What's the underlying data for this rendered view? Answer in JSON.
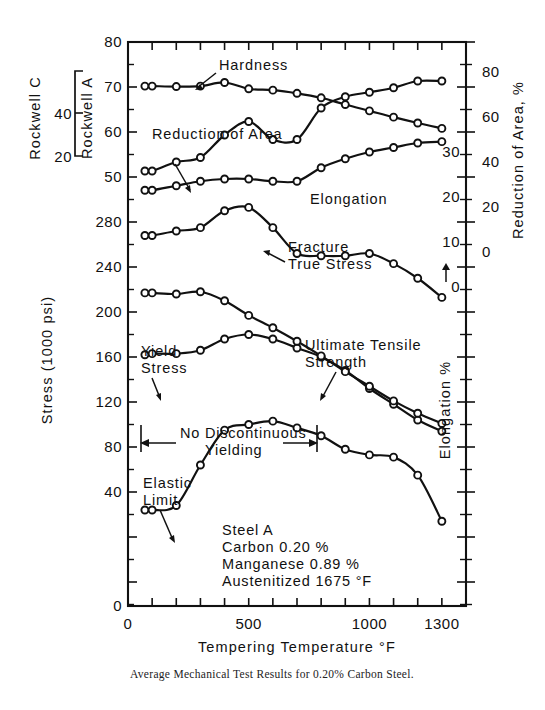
{
  "figure": {
    "caption": "Average Mechanical Test Results for 0.20% Carbon Steel."
  },
  "axes": {
    "x": {
      "title": "Tempering Temperature °F",
      "labels": [
        "0",
        "500",
        "1000",
        "1300"
      ],
      "label_values": [
        0,
        500,
        1000,
        1300
      ],
      "range": [
        0,
        1400
      ],
      "tick_step": 100
    },
    "left_stress": {
      "title": "Stress (1000 psi)",
      "labels": [
        "0",
        "40",
        "80",
        "120",
        "160",
        "200",
        "240",
        "280"
      ],
      "range": [
        0,
        300
      ]
    },
    "left_rockwell_a": {
      "title": "Rockwell A",
      "labels": [
        "50",
        "60",
        "70",
        "80"
      ],
      "range": [
        45,
        80
      ]
    },
    "left_rockwell_c": {
      "title": "Rockwell C",
      "labels": [
        "20",
        "40"
      ]
    },
    "right_elongation": {
      "title": "Elongation %",
      "labels": [
        "0",
        "10",
        "20",
        "30"
      ],
      "arrow": "↑"
    },
    "right_reduction": {
      "title": "Reduction of Area, %",
      "labels": [
        "0",
        "20",
        "40",
        "60",
        "80"
      ]
    }
  },
  "annotations": {
    "no_discontinuous_yielding": {
      "line1": "No Discontinuous",
      "line2": "Yielding",
      "arrow_left": "←",
      "arrow_right": "→"
    },
    "specimen": {
      "line1": "Steel A",
      "line2": "Carbon 0.20 %",
      "line3": "Manganese 0.89 %",
      "line4": "Austenitized 1675 °F"
    }
  },
  "chart_data": {
    "type": "line",
    "title": "Average Mechanical Test Results for 0.20% Carbon Steel.",
    "xlabel": "Tempering Temperature °F",
    "ylabel": "Stress (1000 psi)",
    "xlim": [
      0,
      1400
    ],
    "grid": false,
    "legend": "inline-labels",
    "series": [
      {
        "name": "Hardness",
        "unit": "Rockwell A",
        "axis": "left-rockwell-a",
        "x": [
          70,
          100,
          200,
          300,
          400,
          500,
          600,
          700,
          800,
          900,
          1000,
          1100,
          1200,
          1300
        ],
        "y": [
          70.2,
          70.2,
          70.1,
          70.2,
          71.0,
          69.6,
          69.3,
          68.6,
          67.6,
          66.1,
          64.7,
          63.3,
          62.0,
          60.8
        ]
      },
      {
        "name": "Reduction of Area",
        "unit": "%",
        "axis": "right-reduction",
        "x": [
          70,
          100,
          200,
          300,
          400,
          500,
          600,
          700,
          800,
          900,
          1000,
          1100,
          1200,
          1300
        ],
        "y": [
          36,
          36,
          40,
          42,
          52,
          58,
          50,
          50,
          64,
          69,
          71,
          73,
          76,
          76
        ]
      },
      {
        "name": "Elongation",
        "unit": "%",
        "axis": "right-elongation",
        "x": [
          70,
          100,
          200,
          300,
          400,
          500,
          600,
          700,
          800,
          900,
          1000,
          1100,
          1200,
          1300
        ],
        "y": [
          21.5,
          21.5,
          22.5,
          23.5,
          24.0,
          24.0,
          23.5,
          23.5,
          26.5,
          28.5,
          30.0,
          31.0,
          32.0,
          32.3
        ]
      },
      {
        "name": "Fracture True Stress",
        "unit": "1000 psi",
        "axis": "left-stress",
        "x": [
          70,
          100,
          200,
          300,
          400,
          500,
          600,
          700,
          800,
          900,
          1000,
          1100,
          1200,
          1300
        ],
        "y": [
          268,
          268,
          272,
          275,
          290,
          293,
          275,
          252,
          250,
          250,
          252,
          243,
          230,
          213
        ]
      },
      {
        "name": "Yield Stress",
        "unit": "1000 psi",
        "axis": "left-stress",
        "x": [
          70,
          100,
          200,
          300,
          400,
          500,
          600,
          700,
          800,
          900,
          1000,
          1100,
          1200,
          1300
        ],
        "y": [
          162,
          163,
          163,
          166,
          176,
          180,
          176,
          168,
          160,
          148,
          132,
          118,
          104,
          94
        ]
      },
      {
        "name": "Ultimate Tensile Strength",
        "unit": "1000 psi",
        "axis": "left-stress",
        "x": [
          70,
          100,
          200,
          300,
          400,
          500,
          600,
          700,
          800,
          900,
          1000,
          1100,
          1200,
          1300
        ],
        "y": [
          217,
          217,
          216,
          218,
          210,
          197,
          186,
          174,
          161,
          147,
          134,
          121,
          110,
          101
        ]
      },
      {
        "name": "Elastic Limit",
        "unit": "1000 psi",
        "axis": "left-stress",
        "x": [
          70,
          100,
          200,
          300,
          400,
          500,
          600,
          700,
          800,
          900,
          1000,
          1100,
          1200,
          1300
        ],
        "y": [
          24,
          24,
          28,
          64,
          95,
          100,
          103,
          97,
          90,
          78,
          73,
          71,
          55,
          14
        ]
      }
    ],
    "series_labels": [
      "Hardness",
      "Reduction of Area",
      "Elongation",
      "Fracture True Stress",
      "Yield Stress",
      "Ultimate Tensile Strength",
      "Elastic Limit"
    ]
  }
}
